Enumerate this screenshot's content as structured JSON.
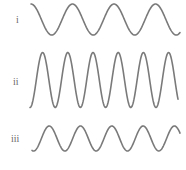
{
  "waves": [
    {
      "label": "i",
      "label_pos": [
        16,
        15
      ],
      "x_start": 31,
      "x_end": 180,
      "center_y": 19.5,
      "amplitude": 15.5,
      "period": 41.5,
      "start_phase": "peak",
      "color": "#7a7a7a"
    },
    {
      "label": "ii",
      "label_pos": [
        13,
        77
      ],
      "x_start": 30,
      "x_end": 178,
      "center_y": 80,
      "amplitude": 27.5,
      "period": 25.2,
      "start_phase_offset": 0.5,
      "color": "#7a7a7a"
    },
    {
      "label": "iii",
      "label_pos": [
        11,
        134
      ],
      "x_start": 32,
      "x_end": 180,
      "center_y": 138.5,
      "amplitude": 12.5,
      "period": 31.3,
      "start_phase_offset": 0.45,
      "color": "#7a7a7a"
    }
  ]
}
